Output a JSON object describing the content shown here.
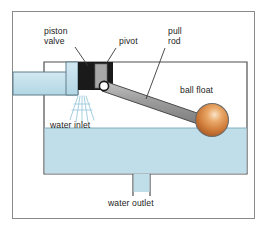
{
  "diagram": {
    "labels": {
      "piston_valve": "piston\nvalve",
      "pivot": "pivot",
      "pull_rod": "pull\nrod",
      "ball_float": "ball float",
      "water_inlet": "water inlet",
      "water_outlet": "water outlet"
    },
    "colors": {
      "water": "#bfdeea",
      "water_stroke": "#5f7f8c",
      "pipe_fill": "#bfdeea",
      "valve_body": "#1a1a1a",
      "piston_fill": "#a8a8a8",
      "rod_fill": "#9a9a9a",
      "rod_stroke": "#4a4a4a",
      "ball_fill": "#d2813f",
      "ball_highlight": "#f6ddc0",
      "frame_stroke": "#8a8a8a",
      "tank_stroke": "#4f4f4f",
      "leader_stroke": "#3a3a3a",
      "spray": "#9cc9dc",
      "text": "#1c1c1c"
    },
    "parts": [
      {
        "name": "tank",
        "desc": "open cistern body filled to waterline"
      },
      {
        "name": "inlet-pipe",
        "desc": "horizontal supply pipe entering from left"
      },
      {
        "name": "piston-valve",
        "desc": "black valve block with grey piston"
      },
      {
        "name": "pivot-pin",
        "desc": "white circular pin joint"
      },
      {
        "name": "pull-rod",
        "desc": "tapered arm from pivot to float"
      },
      {
        "name": "ball-float",
        "desc": "copper sphere floating on water surface"
      },
      {
        "name": "outlet-pipe",
        "desc": "vertical drain pipe at tank base"
      },
      {
        "name": "water-spray",
        "desc": "fan of jets below valve outlet"
      }
    ]
  }
}
